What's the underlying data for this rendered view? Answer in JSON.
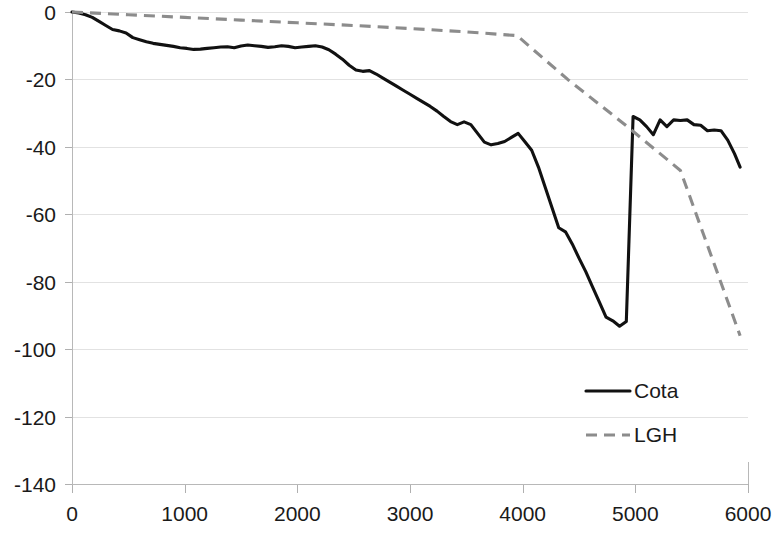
{
  "chart_data": {
    "type": "line",
    "title": "",
    "subtitle": "",
    "xlabel": "",
    "ylabel": "",
    "xlim": [
      0,
      6000
    ],
    "ylim": [
      -140,
      0
    ],
    "x_ticks": [
      0,
      1000,
      2000,
      3000,
      4000,
      5000,
      6000
    ],
    "x_tick_labels": [
      "0",
      "1000",
      "2000",
      "3000",
      "4000",
      "5000",
      "6000"
    ],
    "y_ticks": [
      0,
      -20,
      -40,
      -60,
      -80,
      -100,
      -120,
      -140
    ],
    "y_tick_labels": [
      "0",
      "-20",
      "-40",
      "-60",
      "-80",
      "-100",
      "-120",
      "-140"
    ],
    "grid": true,
    "grid_axis": "y",
    "legend_position": "inside-bottom-right",
    "series": [
      {
        "name": "Cota",
        "style": "solid",
        "color": "#111111",
        "x": [
          0,
          60,
          120,
          180,
          240,
          300,
          360,
          420,
          480,
          540,
          600,
          660,
          720,
          780,
          840,
          900,
          960,
          1020,
          1080,
          1140,
          1200,
          1260,
          1320,
          1380,
          1440,
          1500,
          1560,
          1620,
          1680,
          1740,
          1800,
          1860,
          1920,
          1980,
          2040,
          2100,
          2160,
          2220,
          2280,
          2340,
          2400,
          2460,
          2520,
          2580,
          2640,
          2700,
          2760,
          2820,
          2880,
          2940,
          3000,
          3060,
          3120,
          3180,
          3240,
          3300,
          3360,
          3420,
          3480,
          3540,
          3600,
          3660,
          3720,
          3780,
          3840,
          3900,
          3960,
          4020,
          4080,
          4140,
          4200,
          4260,
          4320,
          4380,
          4440,
          4500,
          4560,
          4620,
          4680,
          4740,
          4800,
          4860,
          4920,
          4980,
          5040,
          5100,
          5160,
          5220,
          5280,
          5340,
          5400,
          5460,
          5520,
          5580,
          5640,
          5700,
          5760,
          5820,
          5880,
          5930
        ],
        "y": [
          0,
          -0.3,
          -0.8,
          -1.6,
          -2.8,
          -4.0,
          -5.2,
          -5.6,
          -6.2,
          -7.6,
          -8.2,
          -8.8,
          -9.3,
          -9.6,
          -9.9,
          -10.2,
          -10.6,
          -10.8,
          -11.1,
          -11.0,
          -10.8,
          -10.6,
          -10.4,
          -10.3,
          -10.6,
          -10.1,
          -9.8,
          -10.0,
          -10.2,
          -10.5,
          -10.3,
          -10.0,
          -10.2,
          -10.6,
          -10.4,
          -10.2,
          -10.0,
          -10.4,
          -11.2,
          -12.5,
          -14.0,
          -15.8,
          -17.2,
          -17.6,
          -17.4,
          -18.4,
          -19.6,
          -20.8,
          -22.0,
          -23.2,
          -24.4,
          -25.6,
          -26.8,
          -28.0,
          -29.4,
          -31.0,
          -32.5,
          -33.4,
          -32.6,
          -33.4,
          -36.0,
          -38.6,
          -39.4,
          -39.0,
          -38.4,
          -37.2,
          -36.0,
          -38.5,
          -41.0,
          -46.0,
          -52.0,
          -58.0,
          -64.0,
          -65.2,
          -68.8,
          -73.0,
          -77.0,
          -81.5,
          -86.0,
          -90.5,
          -91.6,
          -93.2,
          -91.8,
          -94.5,
          -98.0,
          -102.0,
          -96.0,
          -92.0,
          -86.0,
          -80.0,
          -74.0,
          -72.6,
          -66.0,
          -58.0,
          -50.2,
          -48.6,
          -44.0,
          -38.0,
          -33.0,
          -31.0
        ],
        "comment_tail_x": [
          4980,
          5040,
          5100,
          5160,
          5220,
          5280,
          5340,
          5400,
          5460,
          5520,
          5580,
          5640,
          5700,
          5760,
          5820,
          5880,
          5930
        ],
        "comment_tail_y": [
          -31.0,
          -32.0,
          -34.0,
          -36.4,
          -32.0,
          -34.0,
          -32.0,
          -32.2,
          -32.0,
          -33.4,
          -33.6,
          -35.2,
          -35.0,
          -35.2,
          -38.0,
          -42.0,
          -46.0
        ]
      },
      {
        "name": "LGH",
        "style": "dashed",
        "color": "#8c8c8c",
        "x": [
          0,
          500,
          1000,
          1500,
          2000,
          2500,
          3000,
          3500,
          3950,
          4400,
          4900,
          5400,
          5930
        ],
        "y": [
          0,
          -0.8,
          -1.6,
          -2.4,
          -3.2,
          -4.0,
          -4.9,
          -5.9,
          -7.0,
          -20.0,
          -33.2,
          -47.0,
          -96.0
        ]
      }
    ],
    "legend_entries": [
      {
        "label": "Cota",
        "style": "solid",
        "color": "#111111"
      },
      {
        "label": "LGH",
        "style": "dashed",
        "color": "#8c8c8c"
      }
    ],
    "colors": {
      "background": "#ffffff",
      "grid": "#e2e2e2",
      "axis": "#b8b8b8",
      "text": "#1a1a1a"
    }
  }
}
